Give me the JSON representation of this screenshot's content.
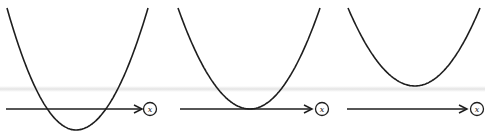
{
  "figure": {
    "colors": {
      "stroke": "#1e1e1e",
      "background": "#ffffff",
      "band": "#e1e1e1"
    },
    "panels": [
      {
        "id": "two-roots",
        "axis_label": "x",
        "curve": {
          "left_top": [
            7,
            8
          ],
          "vertex": [
            76,
            130
          ],
          "right_top": [
            148,
            8
          ]
        },
        "axis": {
          "x1": 6,
          "x2": 140,
          "y": 109
        },
        "label_circle": {
          "cx": 150,
          "cy": 109
        }
      },
      {
        "id": "one-root",
        "axis_label": "x",
        "curve": {
          "left_top": [
            178,
            8
          ],
          "vertex": [
            250,
            109
          ],
          "right_top": [
            320,
            8
          ]
        },
        "axis": {
          "x1": 180,
          "x2": 310,
          "y": 109
        },
        "label_circle": {
          "cx": 322,
          "cy": 109
        }
      },
      {
        "id": "no-roots",
        "axis_label": "x",
        "curve": {
          "left_top": [
            348,
            8
          ],
          "vertex": [
            415,
            86
          ],
          "right_top": [
            480,
            8
          ]
        },
        "axis": {
          "x1": 347,
          "x2": 465,
          "y": 109
        },
        "label_circle": {
          "cx": 477,
          "cy": 109
        }
      }
    ]
  }
}
